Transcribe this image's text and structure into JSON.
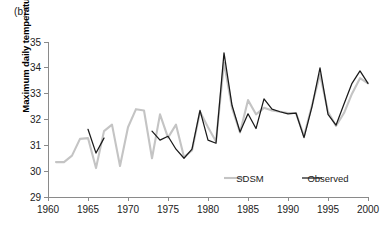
{
  "figure": {
    "panel_label": "(b)",
    "background_color": "#ffffff"
  },
  "chart_data": {
    "type": "line",
    "title": "",
    "subtitle": "",
    "xlabel": "",
    "ylabel": "Maximum daily temperature (°C)",
    "xlim": [
      1960,
      2000
    ],
    "ylim": [
      29,
      35
    ],
    "xticks": [
      1960,
      1965,
      1970,
      1975,
      1980,
      1985,
      1990,
      1995,
      2000
    ],
    "yticks": [
      29,
      30,
      31,
      32,
      33,
      34,
      35
    ],
    "grid": false,
    "legend_position": "inside-bottom-right",
    "legend": [
      "SDSM",
      "Observed"
    ],
    "colors": {
      "sdsm": "#c4c4c4",
      "observed": "#1a1a1a",
      "axis": "#8a8a8a",
      "text": "#222222"
    },
    "series": [
      {
        "name": "SDSM",
        "color": "#c4c4c4",
        "x": [
          1961,
          1962,
          1963,
          1964,
          1965,
          1966,
          1967,
          1968,
          1969,
          1970,
          1971,
          1972,
          1973,
          1974,
          1975,
          1976,
          1977,
          1978,
          1979,
          1980,
          1981,
          1982,
          1983,
          1984,
          1985,
          1986,
          1987,
          1988,
          1989,
          1990,
          1991,
          1992,
          1993,
          1994,
          1995,
          1996,
          1997,
          1998,
          1999,
          2000
        ],
        "values": [
          30.35,
          30.35,
          30.6,
          31.25,
          31.28,
          30.12,
          31.55,
          31.8,
          30.2,
          31.7,
          32.4,
          32.35,
          30.5,
          32.2,
          31.3,
          31.8,
          30.55,
          30.8,
          32.3,
          31.7,
          31.15,
          34.2,
          32.45,
          31.5,
          32.75,
          32.2,
          32.45,
          32.35,
          32.3,
          32.25,
          32.25,
          31.35,
          32.55,
          33.75,
          32.3,
          31.75,
          32.25,
          33.0,
          33.6,
          33.4
        ]
      },
      {
        "name": "Observed",
        "color": "#1a1a1a",
        "segments": [
          {
            "x": [
              1965,
              1966,
              1967
            ],
            "values": [
              31.62,
              30.7,
              31.28
            ]
          },
          {
            "x": [
              1973,
              1974,
              1975,
              1976,
              1977,
              1978,
              1979,
              1980,
              1981,
              1982,
              1983,
              1984,
              1985,
              1986,
              1987,
              1988,
              1989,
              1990,
              1991,
              1992,
              1993,
              1994,
              1995,
              1996,
              1997,
              1998,
              1999,
              2000
            ],
            "values": [
              31.55,
              31.2,
              31.35,
              30.85,
              30.5,
              30.85,
              32.35,
              31.2,
              31.08,
              34.58,
              32.55,
              31.52,
              32.22,
              31.65,
              32.8,
              32.4,
              32.3,
              32.22,
              32.25,
              31.3,
              32.5,
              34.0,
              32.2,
              31.78,
              32.6,
              33.4,
              33.88,
              33.4
            ]
          }
        ]
      }
    ]
  },
  "legend_items": [
    {
      "label": "SDSM",
      "color": "#c4c4c4"
    },
    {
      "label": "Observed",
      "color": "#1a1a1a"
    }
  ],
  "axis_labels": {
    "y": [
      "35",
      "34",
      "33",
      "32",
      "31",
      "30",
      "29"
    ],
    "x": [
      "1960",
      "1965",
      "1970",
      "1975",
      "1980",
      "1985",
      "1990",
      "1995",
      "2000"
    ]
  }
}
